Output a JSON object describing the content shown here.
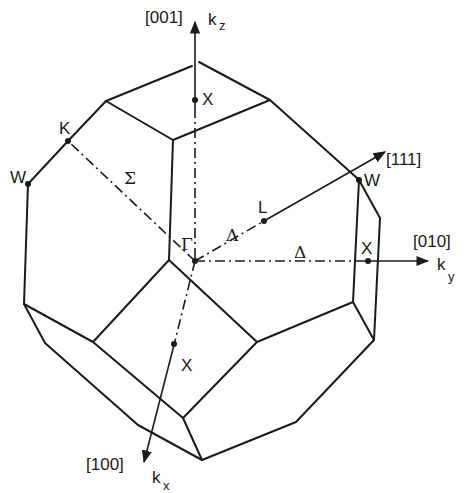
{
  "figure": {
    "type": "first Brillouin zone (truncated octahedron)",
    "directions": {
      "z": "[001]",
      "y": "[010]",
      "x": "[100]",
      "diag": "[111]"
    },
    "axes": {
      "kz": {
        "k": "k",
        "sub": "z"
      },
      "ky": {
        "k": "k",
        "sub": "y"
      },
      "kx": {
        "k": "k",
        "sub": "x"
      }
    },
    "points": {
      "gamma": "Γ",
      "x_top": "X",
      "x_right": "X",
      "x_front": "X",
      "l": "L",
      "k": "K",
      "w_left": "W",
      "w_right": "W"
    },
    "lines": {
      "sigma": "Σ",
      "lambda": "Λ",
      "delta": "Δ"
    }
  }
}
